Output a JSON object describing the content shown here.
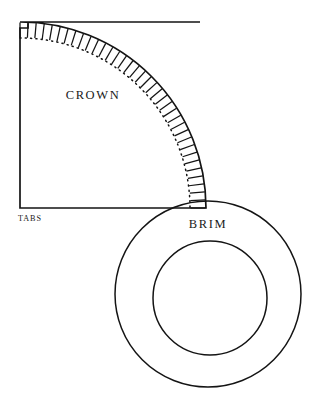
{
  "document": {
    "title": "Hat Sewing Pattern Sheet",
    "background_color": "#ffffff",
    "ink_color": "#141414",
    "width": 331,
    "height": 417
  },
  "pieces": [
    {
      "id": "crown",
      "label": "CROWN",
      "shape": "quarter-circle-sector",
      "label_position": {
        "x": 93,
        "y": 99
      },
      "geometry": {
        "pivot_x": 20,
        "pivot_y": 208,
        "top_edge_y": 22,
        "top_edge_x_start": 28,
        "top_edge_x_end": 200,
        "left_edge_x": 20,
        "left_edge_y_top": 28,
        "left_edge_y_bottom": 208,
        "notch_width": 8,
        "notch_height": 6,
        "seam_arc_radius": 170,
        "outer_arc_radius": 186,
        "arc_start_angle_deg": -90,
        "arc_end_angle_deg": 0,
        "tab_count": 36
      }
    },
    {
      "id": "tabs",
      "label": "TABS",
      "label_position": {
        "x": 18,
        "y": 221
      },
      "description": "notched seam allowance tabs along curved edge of crown"
    },
    {
      "id": "brim",
      "label": "BRIM",
      "shape": "annulus",
      "label_position": {
        "x": 208,
        "y": 228
      },
      "geometry": {
        "outer_center_x": 208,
        "outer_center_y": 294,
        "outer_radius": 93,
        "inner_center_x": 210,
        "inner_center_y": 298,
        "inner_radius": 57
      }
    }
  ]
}
